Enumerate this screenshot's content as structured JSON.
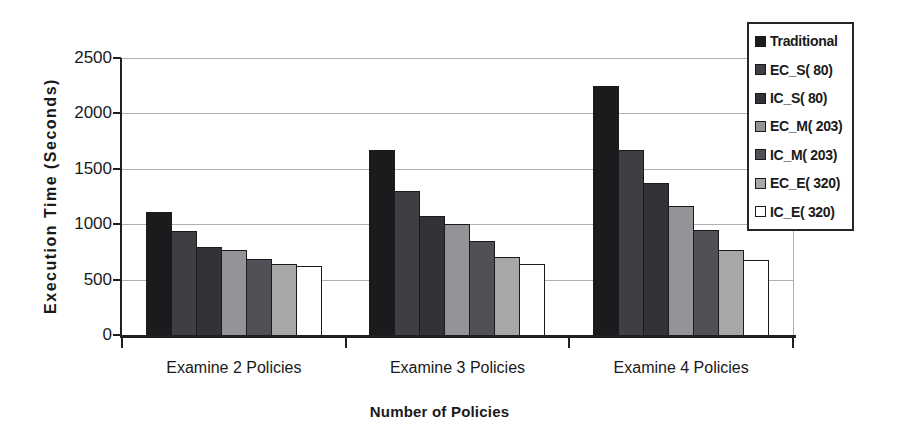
{
  "chart_data": {
    "type": "bar",
    "title": "",
    "xlabel": "Number of Policies",
    "ylabel": "Execution Time (Seconds)",
    "ylim": [
      0,
      2500
    ],
    "yticks": [
      0,
      500,
      1000,
      1500,
      2000,
      2500
    ],
    "categories": [
      "Examine 2 Policies",
      "Examine 3 Policies",
      "Examine 4 Policies"
    ],
    "series": [
      {
        "name": "Traditional",
        "color": "#1b1b1d",
        "values": [
          1110,
          1670,
          2250
        ]
      },
      {
        "name": "EC_S( 80)",
        "color": "#3e3e43",
        "values": [
          940,
          1300,
          1670
        ]
      },
      {
        "name": "IC_S( 80)",
        "color": "#323237",
        "values": [
          790,
          1070,
          1370
        ]
      },
      {
        "name": "EC_M( 203)",
        "color": "#939398",
        "values": [
          765,
          1000,
          1160
        ]
      },
      {
        "name": "IC_M( 203)",
        "color": "#505056",
        "values": [
          685,
          845,
          945
        ]
      },
      {
        "name": "EC_E( 320)",
        "color": "#a7a7aa",
        "values": [
          645,
          700,
          765
        ]
      },
      {
        "name": "IC_E( 320)",
        "color": "#ffffff",
        "values": [
          625,
          645,
          680
        ]
      }
    ],
    "grid": true,
    "legend_position": "top-right"
  },
  "colors": {
    "background": "#ffffff",
    "text": "#1a1a1a",
    "gridline": "#b0b0b0",
    "axis": "#1f1f1f",
    "bar_border": "#1b1b1d",
    "legend_border": "#262626"
  }
}
